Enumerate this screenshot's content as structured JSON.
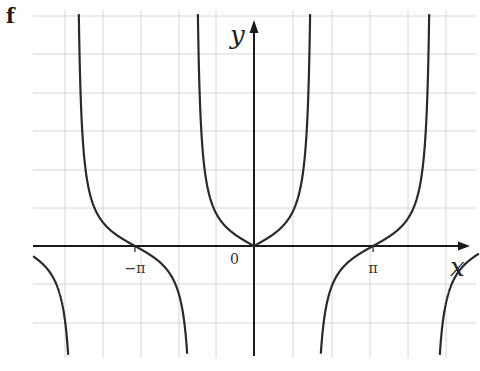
{
  "panel": {
    "label": "f"
  },
  "chart_data": {
    "type": "line",
    "title": "",
    "function": "y = tan|x|",
    "xlabel": "x",
    "ylabel": "y",
    "origin_label": "0",
    "x_ticks": [
      {
        "value": -3.14159,
        "label": "−π"
      },
      {
        "value": 3.14159,
        "label": "π"
      }
    ],
    "xlim": [
      -4.4,
      4.0
    ],
    "ylim": [
      -5.3,
      11.0
    ],
    "grid": true,
    "grid_spacing": {
      "x_rad": 1.0166,
      "y_units": 1.81
    },
    "asymptotes": [
      -4.71239,
      -1.5708,
      1.5708,
      4.71239
    ],
    "series": [
      {
        "name": "branch-left-lower",
        "x_range": [
          -4.4,
          -4.74
        ],
        "note": "tan|x| for x < -3π/2, negative values"
      },
      {
        "name": "branch-left",
        "x_range": [
          -4.69,
          -1.61
        ],
        "note": "decreasing, crosses zero at -π"
      },
      {
        "name": "branch-center",
        "x_range": [
          -1.53,
          1.53
        ],
        "note": "V-shaped U, minimum 0 at origin"
      },
      {
        "name": "branch-right",
        "x_range": [
          1.61,
          4.69
        ],
        "note": "increasing, crosses zero at π"
      },
      {
        "name": "branch-right-lower",
        "x_range": [
          4.74,
          5.9
        ],
        "note": "tan|x| for x > 3π/2, negative values"
      }
    ],
    "sample_points": [
      {
        "x": 0,
        "y": 0
      },
      {
        "x": 0.785,
        "y": 1
      },
      {
        "x": -0.785,
        "y": 1
      },
      {
        "x": 3.14159,
        "y": 0
      },
      {
        "x": -3.14159,
        "y": 0
      },
      {
        "x": 2.356,
        "y": -1
      },
      {
        "x": 3.927,
        "y": 1
      },
      {
        "x": -2.356,
        "y": -1
      },
      {
        "x": -3.927,
        "y": 1
      }
    ]
  },
  "layout": {
    "origin_px": [
      254,
      246
    ],
    "px_per_rad": 37.9,
    "px_per_unit": 21,
    "grid_x_px": [
      65,
      103,
      141,
      179,
      216,
      254,
      293,
      332,
      370,
      408,
      446
    ],
    "grid_y_px": [
      16,
      54,
      93,
      131,
      170,
      208,
      284,
      323
    ],
    "plot_box": [
      33,
      10,
      476,
      358
    ],
    "colors": {
      "grid": "#d6d6d6",
      "axis": "#1a1a1a",
      "curve": "#2a2a2a",
      "background": "#ffffff"
    }
  }
}
